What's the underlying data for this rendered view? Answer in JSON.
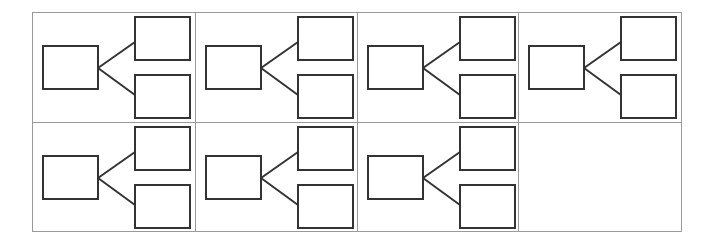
{
  "diagram": {
    "type": "tree-template-grid",
    "grid": {
      "columns": 4,
      "rows": 2
    },
    "colors": {
      "grid_line": "#9a9a9a",
      "shape_stroke": "#333333",
      "background": "#ffffff"
    },
    "cells": [
      {
        "id": "cell-1",
        "row": 0,
        "col": 0,
        "has_diagram": true
      },
      {
        "id": "cell-2",
        "row": 0,
        "col": 1,
        "has_diagram": true
      },
      {
        "id": "cell-3",
        "row": 0,
        "col": 2,
        "has_diagram": true
      },
      {
        "id": "cell-4",
        "row": 0,
        "col": 3,
        "has_diagram": true
      },
      {
        "id": "cell-5",
        "row": 1,
        "col": 0,
        "has_diagram": true
      },
      {
        "id": "cell-6",
        "row": 1,
        "col": 1,
        "has_diagram": true
      },
      {
        "id": "cell-7",
        "row": 1,
        "col": 2,
        "has_diagram": true
      },
      {
        "id": "cell-8",
        "row": 1,
        "col": 3,
        "has_diagram": false
      }
    ],
    "node_structure": {
      "parent_boxes": 1,
      "child_boxes": 2,
      "connectors": 2,
      "labels": []
    }
  }
}
